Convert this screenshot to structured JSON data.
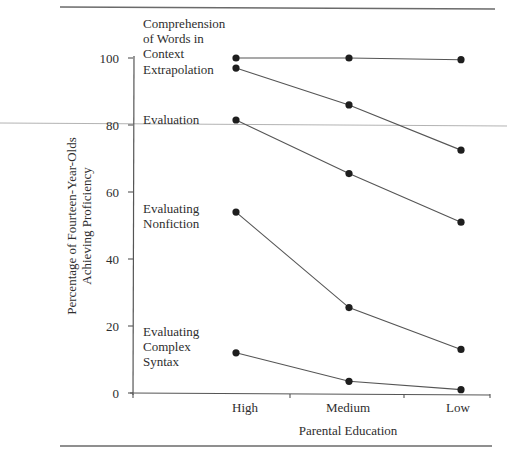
{
  "chart_data": {
    "type": "line",
    "title": "",
    "xlabel": "Parental Education",
    "ylabel": "Percentage of Fourteen-Year-Olds Achieving Proficiency",
    "ylabel_lines": [
      "Percentage of Fourteen-Year-Olds",
      "Achieving Proficiency"
    ],
    "categories": [
      "High",
      "Medium",
      "Low"
    ],
    "ylim": [
      0,
      100
    ],
    "yticks": [
      0,
      20,
      40,
      60,
      80,
      100
    ],
    "grid": false,
    "legend": "inline labels on left of plot",
    "series": [
      {
        "name": "Comprehension of Words in Context",
        "label_lines": [
          "Comprehension",
          "of Words in",
          "Context"
        ],
        "values": [
          100,
          100,
          99.5
        ]
      },
      {
        "name": "Extrapolation",
        "label_lines": [
          "Extrapolation"
        ],
        "values": [
          97,
          86,
          72.5
        ]
      },
      {
        "name": "Evaluation",
        "label_lines": [
          "Evaluation"
        ],
        "values": [
          81.5,
          65.5,
          51
        ]
      },
      {
        "name": "Evaluating Nonfiction",
        "label_lines": [
          "Evaluating",
          "Nonfiction"
        ],
        "values": [
          54,
          25.5,
          13
        ]
      },
      {
        "name": "Evaluating Complex Syntax",
        "label_lines": [
          "Evaluating",
          "Complex",
          "Syntax"
        ],
        "values": [
          12,
          3.5,
          1
        ]
      }
    ]
  },
  "colors": {
    "line": "#555555",
    "marker": "#1e1e1e",
    "axis": "#555555",
    "rule": "#6a6a6a",
    "artifact_line": "#9a9a9a"
  }
}
